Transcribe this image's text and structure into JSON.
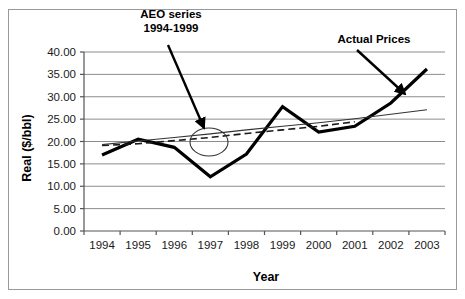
{
  "figure": {
    "border_color": "#999999",
    "background": "#ffffff"
  },
  "chart_data": {
    "type": "line",
    "title": "",
    "xlabel": "Year",
    "ylabel": "Real ($/bbl)",
    "categories": [
      "1994",
      "1995",
      "1996",
      "1997",
      "1998",
      "1999",
      "2000",
      "2001",
      "2002",
      "2003"
    ],
    "x": [
      1994,
      1995,
      1996,
      1997,
      1998,
      1999,
      2000,
      2001,
      2002,
      2003
    ],
    "xlim": [
      1993.5,
      2003.5
    ],
    "ylim": [
      0.0,
      40.0
    ],
    "yticks": [
      "0.00",
      "5.00",
      "10.00",
      "15.00",
      "20.00",
      "25.00",
      "30.00",
      "35.00",
      "40.00"
    ],
    "ytick_values": [
      0,
      5,
      10,
      15,
      20,
      25,
      30,
      35,
      40
    ],
    "grid": "horizontal",
    "legend": "none",
    "series": [
      {
        "name": "Actual Prices",
        "style": "thick-solid",
        "color": "#000000",
        "width": 3.2,
        "values": [
          17.0,
          20.5,
          18.7,
          12.1,
          17.2,
          27.8,
          22.1,
          23.4,
          28.6,
          36.2
        ]
      },
      {
        "name": "AEO series 1994-1999",
        "style": "dashed",
        "color": "#1a1a1a",
        "width": 1.6,
        "values": [
          19.1,
          19.5,
          20.2,
          20.9,
          21.8,
          22.6,
          23.4,
          24.4,
          null,
          null
        ]
      },
      {
        "name": "Trend line",
        "style": "thin-solid",
        "color": "#333333",
        "width": 1.1,
        "values": [
          19.3,
          20.1,
          20.9,
          21.7,
          22.6,
          23.4,
          24.2,
          25.1,
          26.1,
          27.1
        ]
      }
    ],
    "annotations": [
      {
        "id": "aeo-series-annotation",
        "lines": [
          "AEO series",
          "1994-1999"
        ],
        "text_x": 171,
        "text_y": 18,
        "arrow_from": [
          168,
          45
        ],
        "arrow_to": [
          204,
          128
        ]
      },
      {
        "id": "actual-prices-annotation",
        "lines": [
          "Actual Prices"
        ],
        "text_x": 374,
        "text_y": 43,
        "arrow_from": [
          357,
          50
        ],
        "arrow_to": [
          405,
          94
        ]
      }
    ],
    "highlight_ellipse": {
      "id": "aeo-highlight-ellipse",
      "cx": 209,
      "cy": 142,
      "rx": 19,
      "ry": 14,
      "stroke": "#333333"
    }
  }
}
